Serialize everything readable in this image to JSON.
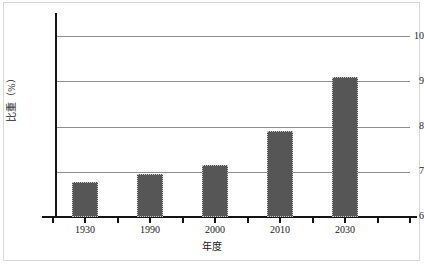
{
  "chart_data": {
    "type": "bar",
    "title": "",
    "xlabel": "年度",
    "ylabel": "比重（%）",
    "categories": [
      "1930",
      "1990",
      "2000",
      "2010",
      "2030"
    ],
    "values": [
      6.78,
      6.95,
      7.16,
      7.9,
      9.1
    ],
    "ylim": [
      6,
      10
    ],
    "yticks": [
      "6",
      "7",
      "8",
      "9",
      "10"
    ],
    "ytick_values": [
      6,
      7,
      8,
      9,
      10
    ],
    "grid": "horizontal",
    "legend": "none",
    "series": [
      {
        "name": "比重（%）",
        "values": [
          6.78,
          6.95,
          7.16,
          7.9,
          9.1
        ]
      }
    ],
    "colors": {
      "bar_fill": "#565656",
      "bar_border": "#c9c9c9",
      "gridline": "#8e8e8e",
      "axis": "#141414",
      "background": "#ffffff",
      "text": "#1a1a1a"
    }
  }
}
